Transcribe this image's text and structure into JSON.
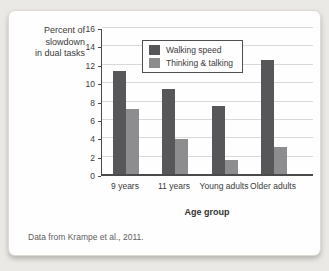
{
  "figure": {
    "caption": "Data from Krampe et al., 2011."
  },
  "colors": {
    "page_background": "#ebe9e6",
    "card_background": "#fefefe",
    "gridline": "#d9d9d9",
    "axis": "#4a4a4a",
    "text": "#3b3b3b"
  },
  "chart_data": {
    "type": "bar",
    "categories": [
      "9 years",
      "11 years",
      "Young adults",
      "Older adults"
    ],
    "series": [
      {
        "name": "Walking speed",
        "color": "#57575a",
        "values": [
          11.2,
          9.3,
          7.4,
          12.4
        ]
      },
      {
        "name": "Thinking & talking",
        "color": "#8d8d90",
        "values": [
          7.1,
          3.8,
          1.5,
          2.9
        ]
      }
    ],
    "xlabel": "Age group",
    "ylabel": "Percent of slowdown in dual tasks",
    "ylabel_lines": [
      "Percent of",
      "slowdown",
      "in dual tasks"
    ],
    "ylim": [
      0,
      16
    ],
    "ytick_step": 2,
    "grid": true,
    "legend_position": "upper center"
  }
}
